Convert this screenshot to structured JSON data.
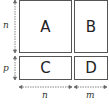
{
  "diagram": {
    "type": "block-matrix",
    "blocks": [
      {
        "id": "A",
        "label": "A"
      },
      {
        "id": "B",
        "label": "B"
      },
      {
        "id": "C",
        "label": "C"
      },
      {
        "id": "D",
        "label": "D"
      }
    ],
    "dimensions": {
      "rows": [
        {
          "label": "n"
        },
        {
          "label": "p"
        }
      ],
      "cols": [
        {
          "label": "n"
        },
        {
          "label": "m"
        }
      ]
    },
    "colors": {
      "stroke": "#555555",
      "text": "#222222",
      "background": "#ffffff"
    }
  }
}
